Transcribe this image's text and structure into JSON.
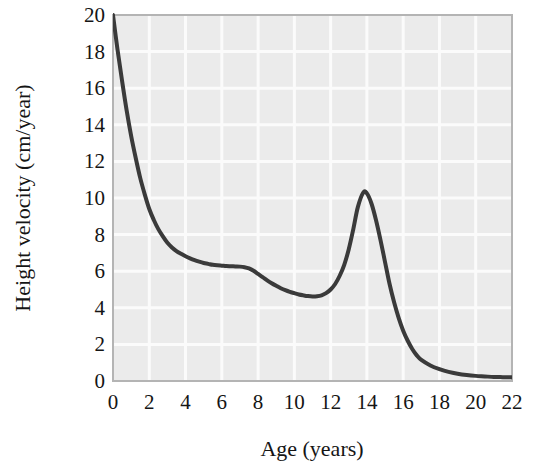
{
  "figure": {
    "background_color": "#ffffff",
    "plot_background_color": "#ebebeb",
    "gridline_color": "#fbfbfb",
    "axis_border_color": "#b4b4b4",
    "curve_color": "#3a3a3a",
    "text_color": "#151515"
  },
  "chart_data": {
    "type": "line",
    "title": "",
    "xlabel": "Age (years)",
    "ylabel": "Height velocity (cm/year)",
    "xlim": [
      0,
      22
    ],
    "ylim": [
      0,
      20
    ],
    "xticks": [
      0,
      2,
      4,
      6,
      8,
      10,
      12,
      14,
      16,
      18,
      20,
      22
    ],
    "yticks": [
      0,
      2,
      4,
      6,
      8,
      10,
      12,
      14,
      16,
      18,
      20
    ],
    "xtick_labels": [
      "0",
      "2",
      "4",
      "6",
      "8",
      "10",
      "12",
      "14",
      "16",
      "18",
      "20",
      "22"
    ],
    "ytick_labels": [
      "0",
      "2",
      "4",
      "6",
      "8",
      "10",
      "12",
      "14",
      "16",
      "18",
      "20"
    ],
    "grid": true,
    "grid_spacing": 2,
    "legend": null,
    "legend_position": "none",
    "series": [
      {
        "name": "Height velocity",
        "x": [
          0,
          0.25,
          0.5,
          0.75,
          1,
          1.25,
          1.5,
          1.75,
          2,
          2.25,
          2.5,
          2.75,
          3,
          3.25,
          3.5,
          3.75,
          4,
          4.25,
          4.5,
          4.75,
          5,
          5.25,
          5.5,
          5.75,
          6,
          6.25,
          6.5,
          6.75,
          7,
          7.25,
          7.5,
          7.75,
          8,
          8.25,
          8.5,
          8.75,
          9,
          9.25,
          9.5,
          9.75,
          10,
          10.25,
          10.5,
          10.75,
          11,
          11.25,
          11.5,
          11.75,
          12,
          12.25,
          12.5,
          12.75,
          13,
          13.25,
          13.5,
          13.8,
          14,
          14.25,
          14.5,
          14.75,
          15,
          15.25,
          15.5,
          15.75,
          16,
          16.25,
          16.5,
          16.75,
          17,
          17.5,
          18,
          18.5,
          19,
          19.5,
          20,
          20.5,
          21,
          21.5,
          22
        ],
        "y": [
          20,
          18.1,
          16.4,
          14.8,
          13.4,
          12.2,
          11.1,
          10.2,
          9.4,
          8.8,
          8.3,
          7.9,
          7.55,
          7.3,
          7.1,
          6.95,
          6.82,
          6.7,
          6.6,
          6.52,
          6.45,
          6.4,
          6.35,
          6.32,
          6.3,
          6.28,
          6.27,
          6.26,
          6.25,
          6.22,
          6.15,
          6.02,
          5.85,
          5.68,
          5.5,
          5.34,
          5.2,
          5.07,
          4.96,
          4.87,
          4.8,
          4.73,
          4.68,
          4.64,
          4.62,
          4.63,
          4.68,
          4.8,
          5.0,
          5.3,
          5.75,
          6.35,
          7.2,
          8.3,
          9.5,
          10.3,
          10.25,
          9.7,
          8.8,
          7.7,
          6.5,
          5.3,
          4.3,
          3.45,
          2.75,
          2.2,
          1.75,
          1.4,
          1.15,
          0.85,
          0.65,
          0.5,
          0.4,
          0.33,
          0.28,
          0.25,
          0.22,
          0.21,
          0.2
        ],
        "color": "#3a3a3a",
        "line_width": 4,
        "markers": false
      }
    ],
    "annotations": [],
    "description_points": [
      {
        "label": "birth velocity",
        "x": 0,
        "y": 20
      },
      {
        "label": "mid-childhood shoulder",
        "x": 7,
        "y": 6.25
      },
      {
        "label": "prepubertal minimum",
        "x": 11,
        "y": 4.62
      },
      {
        "label": "pubertal peak",
        "x": 13.8,
        "y": 10.3
      },
      {
        "label": "adult plateau",
        "x": 22,
        "y": 0.2
      }
    ]
  },
  "geometry": {
    "plot_left": 113,
    "plot_top": 15,
    "plot_right": 512,
    "plot_bottom": 381
  }
}
